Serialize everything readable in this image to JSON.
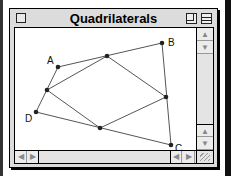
{
  "window": {
    "title": "Quadrilaterals",
    "close_box": "close-box",
    "zoom_box": "zoom-box",
    "collapse_box": "collapse-box"
  },
  "figure": {
    "vertices": [
      {
        "label": "A",
        "x": 43,
        "y": 39
      },
      {
        "label": "B",
        "x": 147,
        "y": 15
      },
      {
        "label": "C",
        "x": 156,
        "y": 117
      },
      {
        "label": "D",
        "x": 21,
        "y": 84
      }
    ],
    "midpoints": [
      {
        "x": 92,
        "y": 28
      },
      {
        "x": 151,
        "y": 69
      },
      {
        "x": 85,
        "y": 100
      },
      {
        "x": 32,
        "y": 62
      }
    ],
    "colors": {
      "line": "#555555",
      "point": "#222222"
    }
  },
  "scrollbars": {
    "vertical": {
      "up": "▲",
      "down": "▼"
    },
    "horizontal": {
      "left": "◀",
      "right": "▶"
    }
  }
}
